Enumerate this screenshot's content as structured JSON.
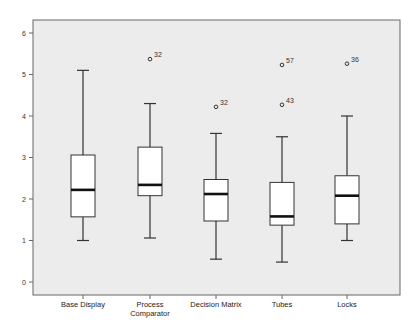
{
  "chart_data": {
    "type": "boxplot",
    "title": "",
    "xlabel": "",
    "ylabel": "",
    "ylim": [
      -0.3,
      6.3
    ],
    "yticks": [
      0,
      1,
      2,
      3,
      4,
      5,
      6
    ],
    "grid": false,
    "legend": null,
    "categories": [
      "Base Display",
      "Process\nComparator",
      "Decision Matrix",
      "Tubes",
      "Locks"
    ],
    "category_labels": [
      [
        "Base Display"
      ],
      [
        "Process",
        "Comparator"
      ],
      [
        "Decision Matrix"
      ],
      [
        "Tubes"
      ],
      [
        "Locks"
      ]
    ],
    "boxes": [
      {
        "name": "Base Display",
        "whisker_low": 1.0,
        "q1": 1.57,
        "median": 2.22,
        "q3": 3.06,
        "whisker_high": 5.1,
        "outliers": []
      },
      {
        "name": "Process Comparator",
        "whisker_low": 1.06,
        "q1": 2.08,
        "median": 2.34,
        "q3": 3.25,
        "whisker_high": 4.3,
        "outliers": [
          {
            "value": 5.37,
            "label": "32"
          }
        ]
      },
      {
        "name": "Decision Matrix",
        "whisker_low": 0.55,
        "q1": 1.47,
        "median": 2.12,
        "q3": 2.47,
        "whisker_high": 3.58,
        "outliers": [
          {
            "value": 4.22,
            "label": "32"
          }
        ]
      },
      {
        "name": "Tubes",
        "whisker_low": 0.48,
        "q1": 1.37,
        "median": 1.58,
        "q3": 2.4,
        "whisker_high": 3.5,
        "outliers": [
          {
            "value": 5.23,
            "label": "57"
          },
          {
            "value": 4.27,
            "label": "43"
          }
        ]
      },
      {
        "name": "Locks",
        "whisker_low": 1.0,
        "q1": 1.4,
        "median": 2.08,
        "q3": 2.56,
        "whisker_high": 4.0,
        "outliers": [
          {
            "value": 5.26,
            "label": "36"
          }
        ]
      }
    ],
    "colors": {
      "plot_background": "#ececec",
      "box_fill": "#ffffff",
      "line": "#333333",
      "frame": "#666666"
    }
  }
}
